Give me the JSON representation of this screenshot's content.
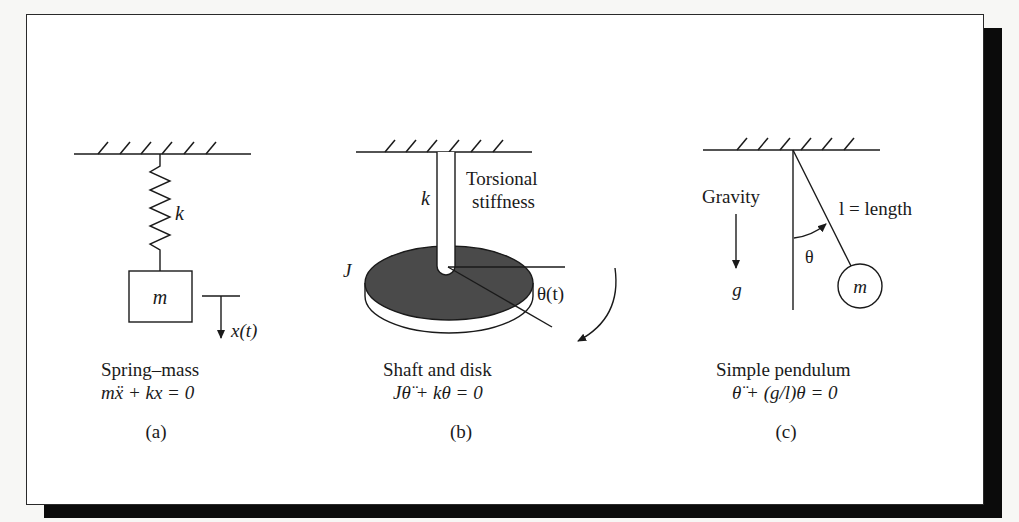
{
  "figure": {
    "panels": [
      {
        "id": "a",
        "tag": "(a)",
        "title": "Spring–mass",
        "equation": "mẍ + kx = 0",
        "labels": {
          "stiffness": "k",
          "mass": "m",
          "displacement": "x(t)"
        }
      },
      {
        "id": "b",
        "tag": "(b)",
        "title": "Shaft and disk",
        "equation": "Jθ̈ + kθ = 0",
        "labels": {
          "stiffness": "k",
          "stiffness_desc_1": "Torsional",
          "stiffness_desc_2": "stiffness",
          "inertia": "J",
          "angle": "θ(t)"
        }
      },
      {
        "id": "c",
        "tag": "(c)",
        "title": "Simple pendulum",
        "equation": "θ̈ + (g/l)θ = 0",
        "labels": {
          "gravity": "Gravity",
          "g": "g",
          "length": "l = length",
          "angle": "θ",
          "mass": "m"
        }
      }
    ],
    "colors": {
      "ink": "#1a1a1a",
      "disk_fill": "#4a4a4a",
      "shadow": "#0b0b0b",
      "background": "#ffffff"
    }
  }
}
